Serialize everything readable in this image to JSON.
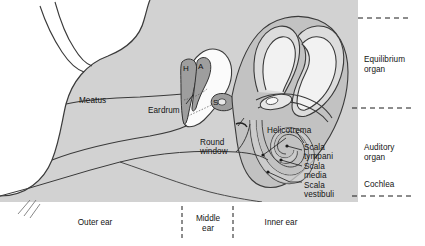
{
  "figure": {
    "background_color": "#ffffff",
    "tissue_fill": "#d0d0d0",
    "tissue_fill_light": "#e2e2e2",
    "tissue_fill_dark": "#b4b4b4",
    "outline_color": "#333333",
    "text_color": "#141414"
  },
  "labels": {
    "meatus": "Meatus",
    "eardrum": "Eardrum",
    "round_window_line1": "Round",
    "round_window_line2": "window",
    "helicotrema": "Helicotrema",
    "scala_tympani_line1": "Scala",
    "scala_tympani_line2": "tympani",
    "scala_media_line1": "Scala",
    "scala_media_line2": "media",
    "scala_vestibuli_line1": "Scala",
    "scala_vestibuli_line2": "vestibuli"
  },
  "ossicles": [
    {
      "code": "H",
      "name": "hammer-malleus"
    },
    {
      "code": "A",
      "name": "anvil-incus"
    },
    {
      "code": "S",
      "name": "stirrup-stapes"
    }
  ],
  "right_annotations": [
    {
      "line1": "Equilibrium",
      "line2": "organ"
    },
    {
      "line1": "Auditory",
      "line2": "organ"
    },
    {
      "line1": "Cochlea",
      "line2": ""
    }
  ],
  "bottom_regions": [
    {
      "line1": "Outer ear",
      "line2": ""
    },
    {
      "line1": "Middle",
      "line2": "ear"
    },
    {
      "line1": "Inner ear",
      "line2": ""
    }
  ]
}
